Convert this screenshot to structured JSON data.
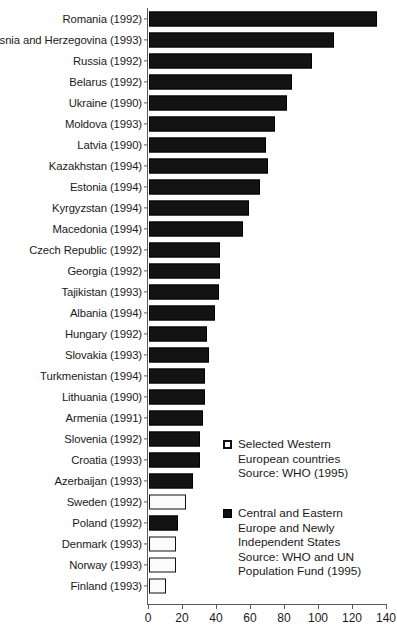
{
  "chart_data": {
    "type": "bar",
    "orientation": "horizontal",
    "title": "",
    "xlabel": "",
    "ylabel": "",
    "xlim": [
      0,
      140
    ],
    "xticks": [
      0,
      20,
      40,
      60,
      80,
      100,
      120,
      140
    ],
    "grid": false,
    "legend_position": "inside-right",
    "categories": [
      "Romania (1992)",
      "Bosnia and Herzegovina (1993)",
      "Russia (1992)",
      "Belarus (1992)",
      "Ukraine (1990)",
      "Moldova (1993)",
      "Latvia (1990)",
      "Kazakhstan (1994)",
      "Estonia (1994)",
      "Kyrgyzstan (1994)",
      "Macedonia (1994)",
      "Czech Republic (1992)",
      "Georgia (1992)",
      "Tajikistan (1993)",
      "Albania (1994)",
      "Hungary (1992)",
      "Slovakia (1993)",
      "Turkmenistan (1994)",
      "Lithuania (1990)",
      "Armenia (1991)",
      "Slovenia (1992)",
      "Croatia (1993)",
      "Azerbaijan (1993)",
      "Sweden (1992)",
      "Poland (1992)",
      "Denmark (1993)",
      "Norway (1993)",
      "Finland (1993)"
    ],
    "values": [
      134,
      109,
      96,
      84,
      81,
      74,
      69,
      70,
      65,
      59,
      55,
      42,
      42,
      41,
      39,
      34,
      35,
      33,
      33,
      32,
      30,
      30,
      26,
      22,
      17,
      16,
      16,
      10
    ],
    "groups": [
      "cee",
      "cee",
      "cee",
      "cee",
      "cee",
      "cee",
      "cee",
      "cee",
      "cee",
      "cee",
      "cee",
      "cee",
      "cee",
      "cee",
      "cee",
      "cee",
      "cee",
      "cee",
      "cee",
      "cee",
      "cee",
      "cee",
      "cee",
      "western",
      "cee",
      "western",
      "western",
      "western"
    ],
    "series": [
      {
        "name": "Selected Western European countries",
        "swatch": "light",
        "color": "#ffffff",
        "edge_color": "#111111"
      },
      {
        "name": "Central and Eastern Europe and Newly Independent States",
        "swatch": "dark",
        "color": "#101010",
        "edge_color": "#000000"
      }
    ]
  },
  "legend": {
    "western": {
      "swatch": "legend-swatch-light",
      "line1": "Selected Western",
      "line2": "European countries",
      "line3": "Source: WHO (1995)"
    },
    "cee": {
      "swatch": "legend-swatch-dark",
      "line1": "Central and Eastern",
      "line2": "Europe and Newly",
      "line3": "Independent States",
      "line4": "Source: WHO and UN",
      "line5": "Population Fund (1995)"
    }
  }
}
